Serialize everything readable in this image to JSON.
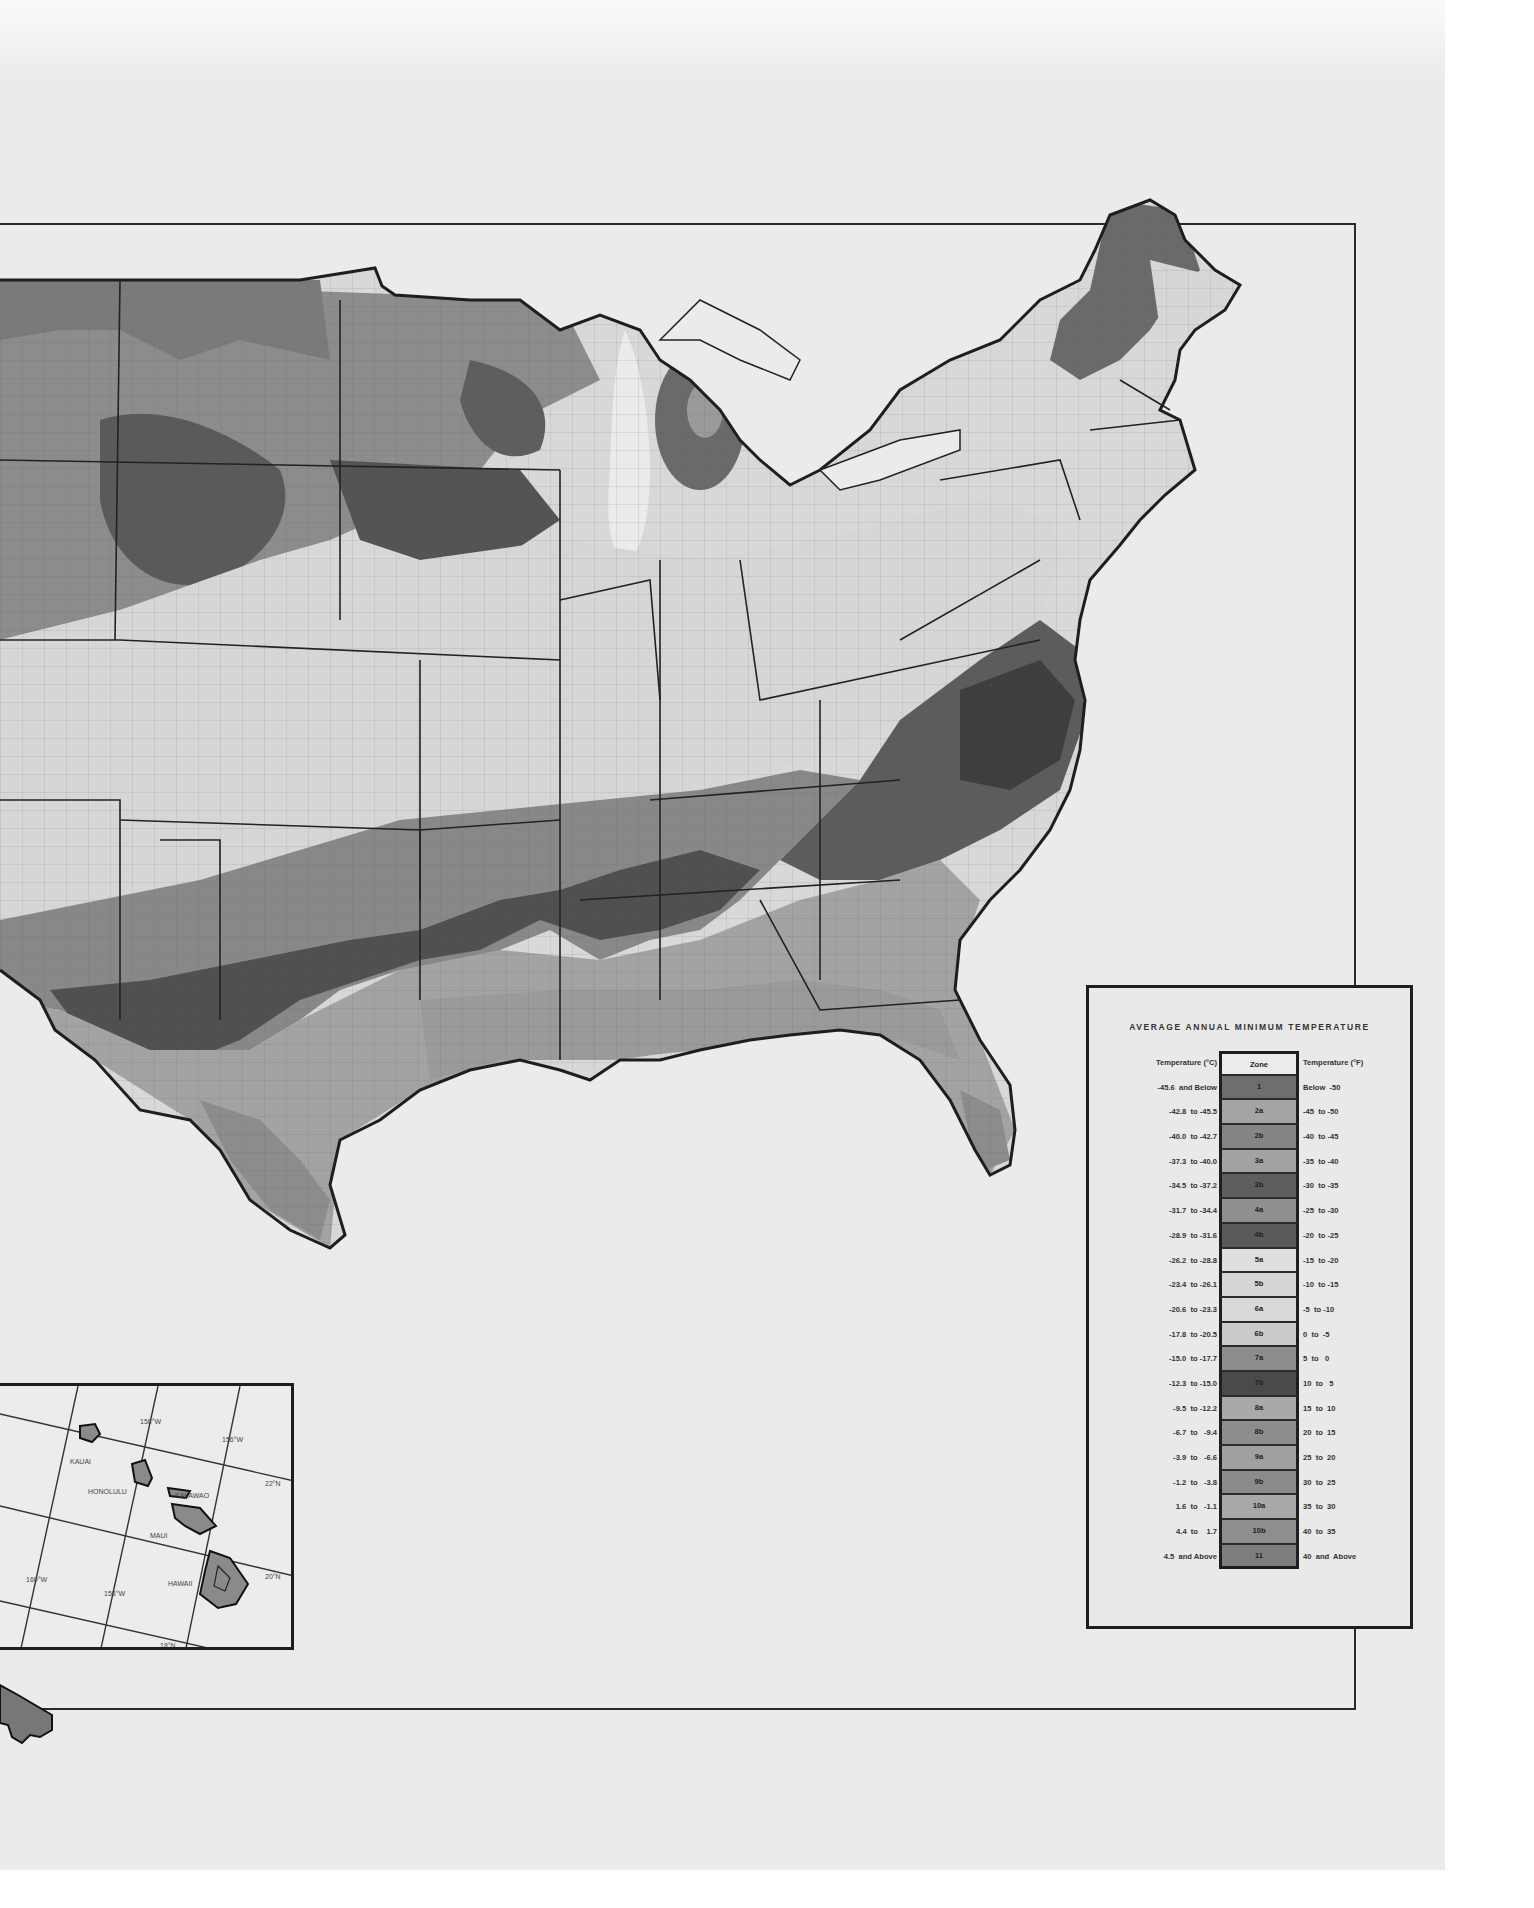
{
  "map": {
    "title": "USDA Plant Hardiness Zone Map (conterminous United States, partial view)",
    "zone_fills": {
      "1": "#6a6a6a",
      "2a": "#9a9a9a",
      "2b": "#7e7e7e",
      "3a": "#a2a2a2",
      "3b": "#5a5a5a",
      "4a": "#8e8e8e",
      "4b": "#585858",
      "5a": "#dcdcdc",
      "5b": "#d2d2d2",
      "6a": "#d6d6d6",
      "6b": "#c8c8c8",
      "7a": "#8a8a8a",
      "7b": "#4c4c4c",
      "8a": "#a8a8a8",
      "8b": "#8c8c8c",
      "9a": "#9e9e9e",
      "9b": "#8a8a8a",
      "10a": "#a6a6a6",
      "10b": "#8c8c8c",
      "11": "#7c7c7c"
    },
    "outline_color": "#1e1e1e",
    "paper_color": "#ebebeb"
  },
  "legend": {
    "title": "AVERAGE ANNUAL MINIMUM TEMPERATURE",
    "header": {
      "celsius": "Temperature (°C)",
      "zone": "Zone",
      "fahrenheit": "Temperature (°F)"
    },
    "rows": [
      {
        "celsius": "-45.6  and Below",
        "zone": "1",
        "fahrenheit": "Below  -50",
        "fill": "#6e6e6e"
      },
      {
        "celsius": "-42.8  to -45.5",
        "zone": "2a",
        "fahrenheit": "-45  to -50",
        "fill": "#a4a4a4"
      },
      {
        "celsius": "-40.0  to -42.7",
        "zone": "2b",
        "fahrenheit": "-40  to -45",
        "fill": "#858585"
      },
      {
        "celsius": "-37.3  to -40.0",
        "zone": "3a",
        "fahrenheit": "-35  to -40",
        "fill": "#a3a3a3"
      },
      {
        "celsius": "-34.5  to -37.2",
        "zone": "3b",
        "fahrenheit": "-30  to -35",
        "fill": "#5e5e5e"
      },
      {
        "celsius": "-31.7  to -34.4",
        "zone": "4a",
        "fahrenheit": "-25  to -30",
        "fill": "#8f8f8f"
      },
      {
        "celsius": "-28.9  to -31.6",
        "zone": "4b",
        "fahrenheit": "-20  to -25",
        "fill": "#5a5a5a"
      },
      {
        "celsius": "-26.2  to -28.8",
        "zone": "5a",
        "fahrenheit": "-15  to -20",
        "fill": "#dedede"
      },
      {
        "celsius": "-23.4  to -26.1",
        "zone": "5b",
        "fahrenheit": "-10  to -15",
        "fill": "#d6d6d6"
      },
      {
        "celsius": "-20.6  to -23.3",
        "zone": "6a",
        "fahrenheit": "-5  to -10",
        "fill": "#d9d9d9"
      },
      {
        "celsius": "-17.8  to -20.5",
        "zone": "6b",
        "fahrenheit": "0  to  -5",
        "fill": "#cbcbcb"
      },
      {
        "celsius": "-15.0  to -17.7",
        "zone": "7a",
        "fahrenheit": "5  to   0",
        "fill": "#8c8c8c"
      },
      {
        "celsius": "-12.3  to -15.0",
        "zone": "7b",
        "fahrenheit": "10  to   5",
        "fill": "#4a4a4a"
      },
      {
        "celsius": "-9.5  to -12.2",
        "zone": "8a",
        "fahrenheit": "15  to  10",
        "fill": "#a9a9a9"
      },
      {
        "celsius": "-6.7  to   -9.4",
        "zone": "8b",
        "fahrenheit": "20  to  15",
        "fill": "#8d8d8d"
      },
      {
        "celsius": "-3.9  to   -6.6",
        "zone": "9a",
        "fahrenheit": "25  to  20",
        "fill": "#a0a0a0"
      },
      {
        "celsius": "-1.2  to   -3.8",
        "zone": "9b",
        "fahrenheit": "30  to  25",
        "fill": "#8b8b8b"
      },
      {
        "celsius": "1.6  to   -1.1",
        "zone": "10a",
        "fahrenheit": "35  to  30",
        "fill": "#a8a8a8"
      },
      {
        "celsius": "4.4  to    1.7",
        "zone": "10b",
        "fahrenheit": "40  to  35",
        "fill": "#8e8e8e"
      },
      {
        "celsius": "4.5  and Above",
        "zone": "11",
        "fahrenheit": "40  and  Above",
        "fill": "#7d7d7d"
      }
    ]
  },
  "hawaii_inset": {
    "islands": [
      "KAUAI",
      "HONOLULU",
      "KALAWAO",
      "MAUI",
      "HAWAII"
    ],
    "grid_labels": [
      "158°W",
      "156°W",
      "160°W",
      "158°W",
      "22°N",
      "20°N",
      "18°N"
    ]
  }
}
